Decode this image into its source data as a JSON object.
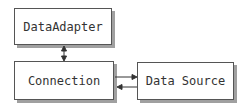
{
  "diagram": {
    "nodes": [
      {
        "id": "adapter",
        "label": "DataAdapter"
      },
      {
        "id": "connection",
        "label": "Connection"
      },
      {
        "id": "source",
        "label": "Data Source"
      }
    ],
    "edges": [
      {
        "from": "adapter",
        "to": "connection",
        "direction": "both"
      },
      {
        "from": "connection",
        "to": "source",
        "direction": "forward"
      },
      {
        "from": "source",
        "to": "connection",
        "direction": "forward"
      }
    ],
    "colors": {
      "border": "#555555",
      "shadow": "#a0a0a0",
      "arrow": "#333333"
    }
  }
}
